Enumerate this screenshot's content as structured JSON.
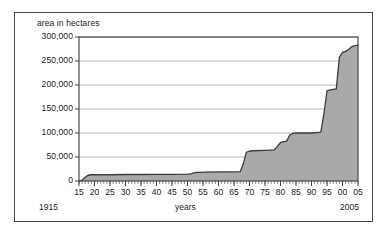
{
  "chart_data": {
    "type": "area",
    "title": "",
    "ylabel": "area in hectares",
    "xlabel": "years",
    "start_year_label": "1915",
    "end_year_label": "2005",
    "ylim": [
      0,
      300000
    ],
    "xlim": [
      1915,
      2005
    ],
    "grid": true,
    "legend": null,
    "series_color": "#a9a9a9",
    "line_color": "#3c3c3c",
    "y_ticks": [
      0,
      50000,
      100000,
      150000,
      200000,
      250000,
      300000
    ],
    "y_tick_labels": [
      "0",
      "50,000",
      "100,000",
      "150,000",
      "200,000",
      "250,000",
      "300,000"
    ],
    "x_ticks": [
      1915,
      1920,
      1925,
      1930,
      1935,
      1940,
      1945,
      1950,
      1955,
      1960,
      1965,
      1970,
      1975,
      1980,
      1985,
      1990,
      1995,
      2000,
      2005
    ],
    "x_tick_labels": [
      "15",
      "20",
      "25",
      "30",
      "35",
      "40",
      "45",
      "50",
      "55",
      "60",
      "65",
      "70",
      "75",
      "80",
      "85",
      "90",
      "95",
      "00",
      "05"
    ],
    "minor_tick_interval_years": 1,
    "x": [
      1915,
      1916,
      1917,
      1918,
      1919,
      1925,
      1930,
      1935,
      1940,
      1945,
      1950,
      1951,
      1952,
      1953,
      1954,
      1955,
      1960,
      1965,
      1967,
      1968,
      1969,
      1970,
      1971,
      1975,
      1978,
      1979,
      1980,
      1981,
      1982,
      1983,
      1984,
      1985,
      1990,
      1992,
      1993,
      1994,
      1995,
      1996,
      1997,
      1998,
      1999,
      2000,
      2001,
      2002,
      2003,
      2004,
      2005
    ],
    "values": [
      0,
      2000,
      8000,
      12000,
      13000,
      13000,
      13500,
      13500,
      14000,
      14000,
      14500,
      15000,
      17000,
      18000,
      18000,
      18500,
      19000,
      19000,
      19500,
      36000,
      60000,
      62000,
      63000,
      64000,
      65000,
      72000,
      80000,
      82000,
      83000,
      96000,
      99000,
      100000,
      100000,
      101000,
      102000,
      140000,
      188000,
      190000,
      191000,
      192000,
      258000,
      268000,
      270000,
      274000,
      280000,
      282000,
      283000
    ]
  }
}
